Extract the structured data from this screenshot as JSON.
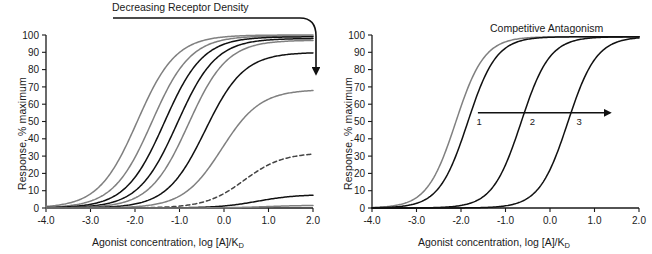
{
  "figure": {
    "width": 652,
    "height": 254,
    "background": "#ffffff"
  },
  "chart_data": [
    {
      "panel": "left",
      "type": "line",
      "title": "Decreasing Receptor Density",
      "xlabel": "Agonist concentration, log [A]/K",
      "xlabel_sub": "D",
      "ylabel": "Response, % maximum",
      "xlim": [
        -4.0,
        2.0
      ],
      "ylim": [
        0,
        100
      ],
      "xticks": [
        "-4.0",
        "-3.0",
        "-2.0",
        "-1.0",
        "0.0",
        "1.0",
        "2.0"
      ],
      "xtick_values": [
        -4.0,
        -3.0,
        -2.0,
        -1.0,
        0.0,
        1.0,
        2.0
      ],
      "yticks": [
        "0",
        "10",
        "20",
        "30",
        "40",
        "50",
        "60",
        "70",
        "80",
        "90",
        "100"
      ],
      "ytick_values": [
        0,
        10,
        20,
        30,
        40,
        50,
        60,
        70,
        80,
        90,
        100
      ],
      "grid": false,
      "legend": "none",
      "annotation": "Curved arrow from title sweeping right then down, indicating successive loss of receptor density",
      "series": [
        {
          "name": "curve-1",
          "ec50": -1.95,
          "emax": 100,
          "slope": 1.0,
          "color": "#808080",
          "style": "solid"
        },
        {
          "name": "curve-2",
          "ec50": -1.62,
          "emax": 99.5,
          "slope": 1.0,
          "color": "#808080",
          "style": "solid"
        },
        {
          "name": "curve-3",
          "ec50": -1.34,
          "emax": 99.0,
          "slope": 1.0,
          "color": "#111111",
          "style": "solid"
        },
        {
          "name": "curve-4",
          "ec50": -1.05,
          "emax": 98.0,
          "slope": 1.0,
          "color": "#111111",
          "style": "solid"
        },
        {
          "name": "curve-5",
          "ec50": -0.8,
          "emax": 97.0,
          "slope": 1.0,
          "color": "#808080",
          "style": "solid"
        },
        {
          "name": "curve-6",
          "ec50": -0.42,
          "emax": 90.0,
          "slope": 1.0,
          "color": "#111111",
          "style": "solid"
        },
        {
          "name": "curve-7",
          "ec50": -0.05,
          "emax": 68.5,
          "slope": 1.0,
          "color": "#808080",
          "style": "solid"
        },
        {
          "name": "curve-8",
          "ec50": 0.45,
          "emax": 32.0,
          "slope": 1.0,
          "color": "#444444",
          "style": "dashed"
        },
        {
          "name": "curve-9",
          "ec50": 0.75,
          "emax": 7.8,
          "slope": 1.0,
          "color": "#111111",
          "style": "solid"
        },
        {
          "name": "curve-10",
          "ec50": 0.95,
          "emax": 1.6,
          "slope": 1.0,
          "color": "#808080",
          "style": "solid"
        }
      ]
    },
    {
      "panel": "right",
      "type": "line",
      "title": "Competitive Antagonism",
      "xlabel": "Agonist concentration, log [A]/K",
      "xlabel_sub": "D",
      "ylabel": "Response, % maximum",
      "xlim": [
        -4.0,
        2.0
      ],
      "ylim": [
        0,
        100
      ],
      "xticks": [
        "-4.0",
        "-3.0",
        "-2.0",
        "-1.0",
        "0.0",
        "1.0",
        "2.0"
      ],
      "xtick_values": [
        -4.0,
        -3.0,
        -2.0,
        -1.0,
        0.0,
        1.0,
        2.0
      ],
      "yticks": [
        "0",
        "10",
        "20",
        "30",
        "40",
        "50",
        "60",
        "70",
        "80",
        "90",
        "100"
      ],
      "ytick_values": [
        0,
        10,
        20,
        30,
        40,
        50,
        60,
        70,
        80,
        90,
        100
      ],
      "grid": false,
      "legend": "none",
      "annotation": "Horizontal arrow pointing right showing dextral displacement of the concentration-response curve",
      "curve_labels": [
        "1",
        "2",
        "3"
      ],
      "series": [
        {
          "name": "control-gray",
          "ec50": -2.12,
          "emax": 99,
          "slope": 1.35,
          "color": "#808080",
          "style": "solid"
        },
        {
          "name": "curve-1",
          "ec50": -1.85,
          "emax": 99,
          "slope": 1.35,
          "color": "#111111",
          "style": "solid"
        },
        {
          "name": "curve-2",
          "ec50": -0.65,
          "emax": 99,
          "slope": 1.35,
          "color": "#111111",
          "style": "solid"
        },
        {
          "name": "curve-3",
          "ec50": 0.4,
          "emax": 99,
          "slope": 1.35,
          "color": "#111111",
          "style": "solid"
        }
      ]
    }
  ],
  "panels": {
    "left": {
      "title": "Decreasing Receptor Density",
      "xlabel_main": "Agonist concentration, log [A]/K",
      "xlabel_sub": "D",
      "ylabel": "Response, % maximum",
      "xticks": [
        "-4.0",
        "-3.0",
        "-2.0",
        "-1.0",
        "0.0",
        "1.0",
        "2.0"
      ],
      "yticks": [
        "100",
        "90",
        "80",
        "70",
        "60",
        "50",
        "40",
        "30",
        "20",
        "10",
        "0"
      ]
    },
    "right": {
      "title": "Competitive Antagonism",
      "xlabel_main": "Agonist concentration, log [A]/K",
      "xlabel_sub": "D",
      "ylabel": "Response, % maximum",
      "xticks": [
        "-4.0",
        "-3.0",
        "-2.0",
        "-1.0",
        "0.0",
        "1.0",
        "2.0"
      ],
      "yticks": [
        "100",
        "90",
        "80",
        "70",
        "60",
        "50",
        "40",
        "30",
        "20",
        "10",
        "0"
      ],
      "curve_labels": [
        "1",
        "2",
        "3"
      ]
    }
  },
  "colors": {
    "axis": "#1a1a1a",
    "curve_black": "#111111",
    "curve_gray": "#808080",
    "curve_dashed": "#444444",
    "background": "#ffffff"
  }
}
